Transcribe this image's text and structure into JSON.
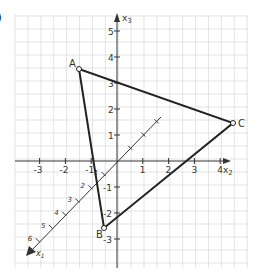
{
  "figure": {
    "part_label": ")",
    "axes": {
      "horizontal": {
        "name": "x",
        "subscript": "2",
        "ticks": [
          "-3",
          "-2",
          "-1",
          "1",
          "2",
          "3",
          "4"
        ]
      },
      "vertical": {
        "name": "x",
        "subscript": "3",
        "ticks": [
          "5",
          "4",
          "3",
          "2",
          "1",
          "-1",
          "-2",
          "-3"
        ]
      },
      "diagonal": {
        "name": "x",
        "subscript": "1",
        "ticks": [
          "1",
          "2",
          "3",
          "4",
          "5",
          "6"
        ]
      }
    },
    "points": [
      {
        "label": "A",
        "x2": -1.5,
        "x3": 3.5
      },
      {
        "label": "B",
        "x2": -0.5,
        "x3": -2.6
      },
      {
        "label": "C",
        "x2": 4.5,
        "x3": 1.5
      }
    ],
    "triangle": [
      "A",
      "B",
      "C"
    ],
    "colors": {
      "grid": "#dcdcdc",
      "axis": "#333333",
      "edge": "#222222"
    }
  }
}
